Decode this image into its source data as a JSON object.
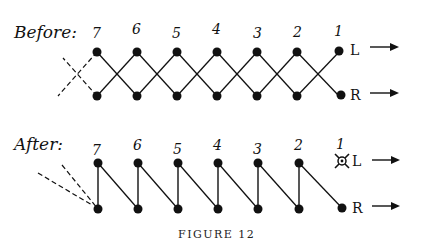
{
  "figure": {
    "caption": "FIGURE 12",
    "before": {
      "label": "Before:",
      "numbers": [
        "7",
        "6",
        "5",
        "4",
        "3",
        "2",
        "1"
      ],
      "left_label": "L",
      "right_label": "R"
    },
    "after": {
      "label": "After:",
      "numbers": [
        "7",
        "6",
        "5",
        "4",
        "3",
        "2",
        "1"
      ],
      "left_label": "L",
      "right_label": "R",
      "removed_node": "1"
    },
    "arrows": [
      "right-arrow",
      "right-arrow",
      "right-arrow",
      "right-arrow"
    ]
  }
}
